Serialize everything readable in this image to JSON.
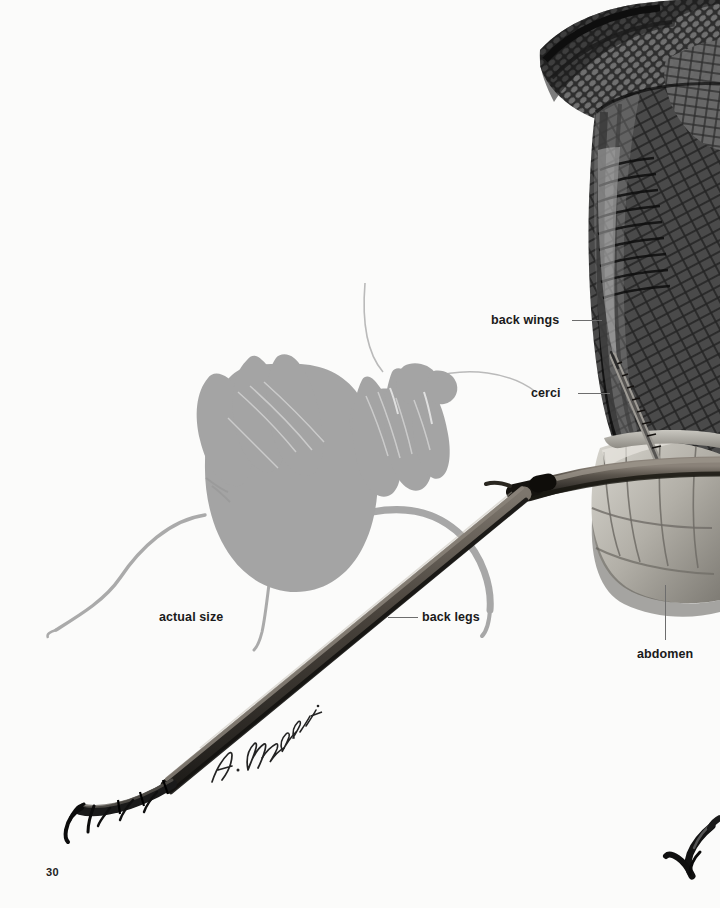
{
  "page": {
    "number": "30",
    "background_color": "#fbfbfa",
    "type": "book-plate"
  },
  "artwork": {
    "signature": "A. Nakanishi",
    "silhouette": {
      "name": "actual-size-mantis-silhouette",
      "color": "#a3a3a3"
    },
    "photo": {
      "name": "magnified-mantis-photograph",
      "wing_color": "#2c2c2c",
      "abdomen_color": "#b3b3ad",
      "leg_color": "#49443f"
    }
  },
  "callouts": [
    {
      "id": "back-wings",
      "label": "back wings",
      "label_x": 491,
      "label_y": 314,
      "leader": {
        "orientation": "h",
        "x": 572,
        "y": 320,
        "length": 30
      }
    },
    {
      "id": "cerci",
      "label": "cerci",
      "label_x": 531,
      "label_y": 387,
      "leader": {
        "orientation": "h",
        "x": 578,
        "y": 393,
        "length": 32
      }
    },
    {
      "id": "back-legs",
      "label": "back legs",
      "label_x": 422,
      "label_y": 611,
      "leader": {
        "orientation": "h",
        "x": 388,
        "y": 617,
        "length": 30
      }
    },
    {
      "id": "abdomen",
      "label": "abdomen",
      "label_x": 637,
      "label_y": 648,
      "leader": {
        "orientation": "v",
        "x": 665,
        "y": 585,
        "length": 55
      }
    },
    {
      "id": "actual-size",
      "label": "actual size",
      "label_x": 159,
      "label_y": 611,
      "leader": null
    }
  ],
  "icons": {
    "tarsal_claw": "claw-icon",
    "antenna": "antenna-icon"
  }
}
